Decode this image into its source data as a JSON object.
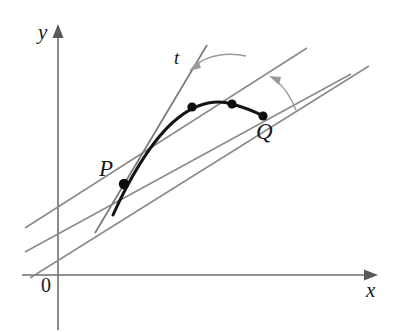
{
  "figure": {
    "background_color": "#ffffff",
    "axes": {
      "x_label": "x",
      "y_label": "y",
      "origin_label": "0",
      "axis_color": "#6f6f6f",
      "x_axis": {
        "x1": 22,
        "y1": 275,
        "x2": 378,
        "y2": 275
      },
      "y_axis": {
        "x1": 58,
        "y1": 330,
        "x2": 58,
        "y2": 24
      }
    },
    "curve": {
      "name": "curve-through-P-and-Q",
      "color": "#141414",
      "path": "M 113,215 C 126,186 150,140 178,118 C 196,104 214,99 232,104 C 246,108 256,112 263,116"
    },
    "tangent": {
      "label": "t",
      "color": "#7a7a7a",
      "x1": 95,
      "y1": 233,
      "x2": 207,
      "y2": 45
    },
    "secants": [
      {
        "name": "secant-to-first-point",
        "color": "#8a8a8a",
        "x1": 25,
        "y1": 228,
        "x2": 307,
        "y2": 48
      },
      {
        "name": "secant-to-second-point",
        "color": "#8a8a8a",
        "x1": 25,
        "y1": 252,
        "x2": 351,
        "y2": 74
      },
      {
        "name": "secant-to-Q",
        "color": "#8a8a8a",
        "x1": 30,
        "y1": 278,
        "x2": 369,
        "y2": 66
      }
    ],
    "points": [
      {
        "name": "point-P",
        "label": "P",
        "x": 124,
        "y": 184,
        "r": 5.2,
        "label_x": 103,
        "label_y": 160
      },
      {
        "name": "point-first-secant",
        "label": "",
        "x": 192,
        "y": 107,
        "r": 4.6
      },
      {
        "name": "point-second-secant",
        "label": "",
        "x": 232,
        "y": 104,
        "r": 4.6
      },
      {
        "name": "point-Q",
        "label": "Q",
        "x": 263,
        "y": 116,
        "r": 4.6,
        "label_x": 258,
        "label_y": 122
      }
    ],
    "arcs": [
      {
        "name": "angle-arc-outer",
        "color": "#9a9a9a",
        "path": "M 246,56 C 228,52 206,56 192,68",
        "arrow_x": 192,
        "arrow_y": 68,
        "arrow_angle": 150
      },
      {
        "name": "angle-arc-inner",
        "color": "#9a9a9a",
        "path": "M 292,105 C 288,92 281,83 272,77",
        "arrow_x": 272,
        "arrow_y": 77,
        "arrow_angle": 215
      }
    ]
  }
}
